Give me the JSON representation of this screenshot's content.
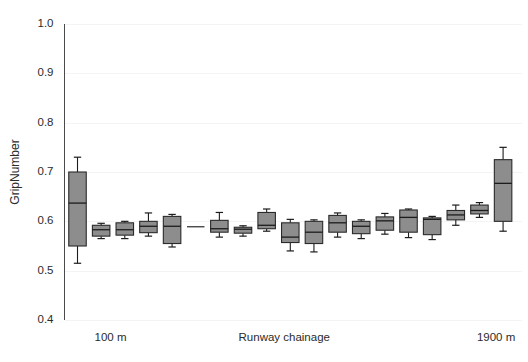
{
  "chart_data": {
    "type": "box",
    "title": "",
    "xlabel": "Runway chainage",
    "ylabel": "GripNumber",
    "ylim": [
      0.4,
      1.0
    ],
    "ytick_labels": [
      "1.0",
      "0.9",
      "0.8",
      "0.7",
      "0.6",
      "0.5",
      "0.4"
    ],
    "ytick_values": [
      1.0,
      0.9,
      0.8,
      0.7,
      0.6,
      0.5,
      0.4
    ],
    "grid": true,
    "legend": null,
    "xtick_labels": [
      "100 m",
      "1900 m"
    ],
    "xtick_label_left": "100 m",
    "xtick_label_right": "1900 m",
    "n_boxes": 19,
    "box_fill_color": "#8d8d8d",
    "box_edge_color": "#2a2a2a",
    "boxes": [
      {
        "label": "100 m",
        "whisker_low": 0.515,
        "q1": 0.55,
        "median": 0.637,
        "q3": 0.7,
        "whisker_high": 0.73
      },
      {
        "label": "200 m",
        "whisker_low": 0.565,
        "q1": 0.57,
        "median": 0.583,
        "q3": 0.592,
        "whisker_high": 0.596
      },
      {
        "label": "300 m",
        "whisker_low": 0.565,
        "q1": 0.572,
        "median": 0.583,
        "q3": 0.597,
        "whisker_high": 0.6
      },
      {
        "label": "400 m",
        "whisker_low": 0.57,
        "q1": 0.577,
        "median": 0.59,
        "q3": 0.6,
        "whisker_high": 0.617
      },
      {
        "label": "500 m",
        "whisker_low": 0.548,
        "q1": 0.555,
        "median": 0.59,
        "q3": 0.61,
        "whisker_high": 0.614
      },
      {
        "label": "600 m",
        "whisker_low": 0.59,
        "q1": 0.59,
        "median": 0.59,
        "q3": 0.59,
        "whisker_high": 0.59
      },
      {
        "label": "700 m",
        "whisker_low": 0.568,
        "q1": 0.578,
        "median": 0.585,
        "q3": 0.602,
        "whisker_high": 0.618
      },
      {
        "label": "800 m",
        "whisker_low": 0.57,
        "q1": 0.576,
        "median": 0.584,
        "q3": 0.588,
        "whisker_high": 0.591
      },
      {
        "label": "900 m",
        "whisker_low": 0.58,
        "q1": 0.585,
        "median": 0.592,
        "q3": 0.618,
        "whisker_high": 0.625
      },
      {
        "label": "1000 m",
        "whisker_low": 0.54,
        "q1": 0.557,
        "median": 0.568,
        "q3": 0.597,
        "whisker_high": 0.604
      },
      {
        "label": "1100 m",
        "whisker_low": 0.538,
        "q1": 0.555,
        "median": 0.578,
        "q3": 0.6,
        "whisker_high": 0.603
      },
      {
        "label": "1200 m",
        "whisker_low": 0.568,
        "q1": 0.578,
        "median": 0.597,
        "q3": 0.612,
        "whisker_high": 0.617
      },
      {
        "label": "1300 m",
        "whisker_low": 0.565,
        "q1": 0.575,
        "median": 0.59,
        "q3": 0.6,
        "whisker_high": 0.603
      },
      {
        "label": "1400 m",
        "whisker_low": 0.574,
        "q1": 0.582,
        "median": 0.601,
        "q3": 0.609,
        "whisker_high": 0.616
      },
      {
        "label": "1500 m",
        "whisker_low": 0.567,
        "q1": 0.578,
        "median": 0.608,
        "q3": 0.623,
        "whisker_high": 0.625
      },
      {
        "label": "1600 m",
        "whisker_low": 0.563,
        "q1": 0.573,
        "median": 0.604,
        "q3": 0.607,
        "whisker_high": 0.61
      },
      {
        "label": "1700 m",
        "whisker_low": 0.592,
        "q1": 0.603,
        "median": 0.613,
        "q3": 0.622,
        "whisker_high": 0.633
      },
      {
        "label": "1800 m",
        "whisker_low": 0.608,
        "q1": 0.615,
        "median": 0.622,
        "q3": 0.633,
        "whisker_high": 0.638
      },
      {
        "label": "1900 m",
        "whisker_low": 0.58,
        "q1": 0.6,
        "median": 0.677,
        "q3": 0.725,
        "whisker_high": 0.75
      }
    ]
  }
}
